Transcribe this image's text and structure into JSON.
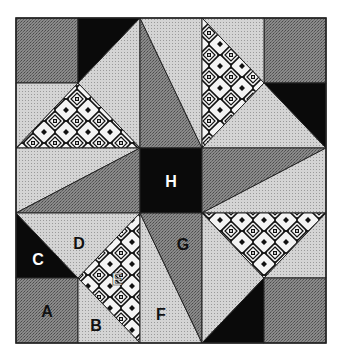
{
  "diagram": {
    "type": "quilt-block",
    "grid": {
      "cols": 5,
      "rows": 5
    },
    "colors": {
      "dark_gray": "#7d7d7d",
      "light_gray": "#cdcdcd",
      "black": "#0a0a0a",
      "pattern_bg": "#ffffff",
      "pattern_fg": "#111111",
      "outline": "#222222",
      "label_dark": "#111111",
      "label_light": "#ffffff"
    },
    "labels": {
      "A": "A",
      "B": "B",
      "C": "C",
      "D": "D",
      "E": "E",
      "F": "F",
      "G": "G",
      "H": "H"
    },
    "pieces": [
      {
        "id": "A",
        "shape": "square",
        "fill": "dark_gray",
        "label": "A"
      },
      {
        "id": "B",
        "shape": "triangle",
        "fill": "light_gray",
        "label": "B"
      },
      {
        "id": "C",
        "shape": "triangle",
        "fill": "black",
        "label": "C"
      },
      {
        "id": "D",
        "shape": "triangle",
        "fill": "light_gray",
        "label": "D"
      },
      {
        "id": "E",
        "shape": "triangle",
        "fill": "pattern",
        "label": "E"
      },
      {
        "id": "F",
        "shape": "triangle",
        "fill": "light_gray",
        "label": "F"
      },
      {
        "id": "G",
        "shape": "triangle",
        "fill": "dark_gray",
        "label": "G"
      },
      {
        "id": "H",
        "shape": "square",
        "fill": "black",
        "label": "H"
      }
    ]
  }
}
